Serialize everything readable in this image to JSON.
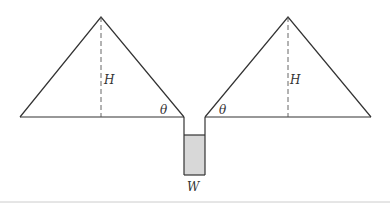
{
  "diagram": {
    "labels": {
      "height_left": "H",
      "height_right": "H",
      "angle_left": "θ",
      "angle_right": "θ",
      "width": "W"
    },
    "colors": {
      "line": "#333333",
      "fill": "#d8d8d8",
      "divider": "#cccccc"
    }
  }
}
